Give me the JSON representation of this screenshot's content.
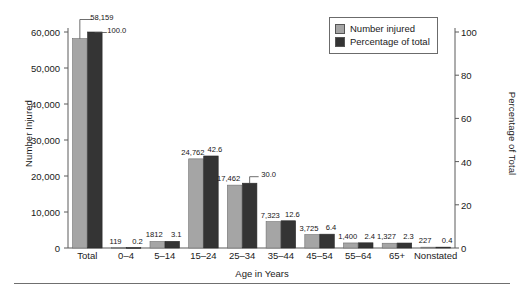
{
  "chart_data": {
    "type": "bar",
    "title": "",
    "subtitle": "",
    "xlabel": "Age in Years",
    "ylabel": "Number Injured",
    "ylabel_secondary": "Percentage of Total",
    "categories": [
      "Total",
      "0–4",
      "5–14",
      "15–24",
      "25–34",
      "35–44",
      "45–54",
      "55–64",
      "65+",
      "Nonstated"
    ],
    "series": [
      {
        "name": "Number injured",
        "axis": "left",
        "color": "#a5a5a5",
        "values": [
          58159,
          119,
          1812,
          24762,
          17462,
          7323,
          3725,
          1400,
          1327,
          227
        ],
        "labels": [
          "58,159",
          "119",
          "1812",
          "24,762",
          "17,462",
          "7,323",
          "3,725",
          "1,400",
          "1,327",
          "227"
        ]
      },
      {
        "name": "Percentage of total",
        "axis": "right",
        "color": "#343434",
        "values": [
          100.0,
          0.2,
          3.1,
          42.6,
          30.0,
          12.6,
          6.4,
          2.4,
          2.3,
          0.4
        ],
        "labels": [
          "100.0",
          "0.2",
          "3.1",
          "42.6",
          "30.0",
          "12.6",
          "6.4",
          "2.4",
          "2.3",
          "0.4"
        ]
      }
    ],
    "ylim": [
      0,
      60000
    ],
    "ylim_secondary": [
      0,
      100
    ],
    "yticks": [
      0,
      10000,
      20000,
      30000,
      40000,
      50000,
      60000
    ],
    "ytick_labels": [
      "0",
      "10,000",
      "20,000",
      "30,000",
      "40,000",
      "50,000",
      "60,000"
    ],
    "yticks_secondary": [
      0,
      20,
      40,
      60,
      80,
      100
    ],
    "ytick_labels_secondary": [
      "0",
      "20",
      "40",
      "60",
      "80",
      "100"
    ],
    "grid": false,
    "legend_position": "top-right"
  },
  "legend": {
    "items": [
      {
        "label": "Number injured",
        "color": "#a5a5a5"
      },
      {
        "label": "Percentage of total",
        "color": "#343434"
      }
    ]
  }
}
